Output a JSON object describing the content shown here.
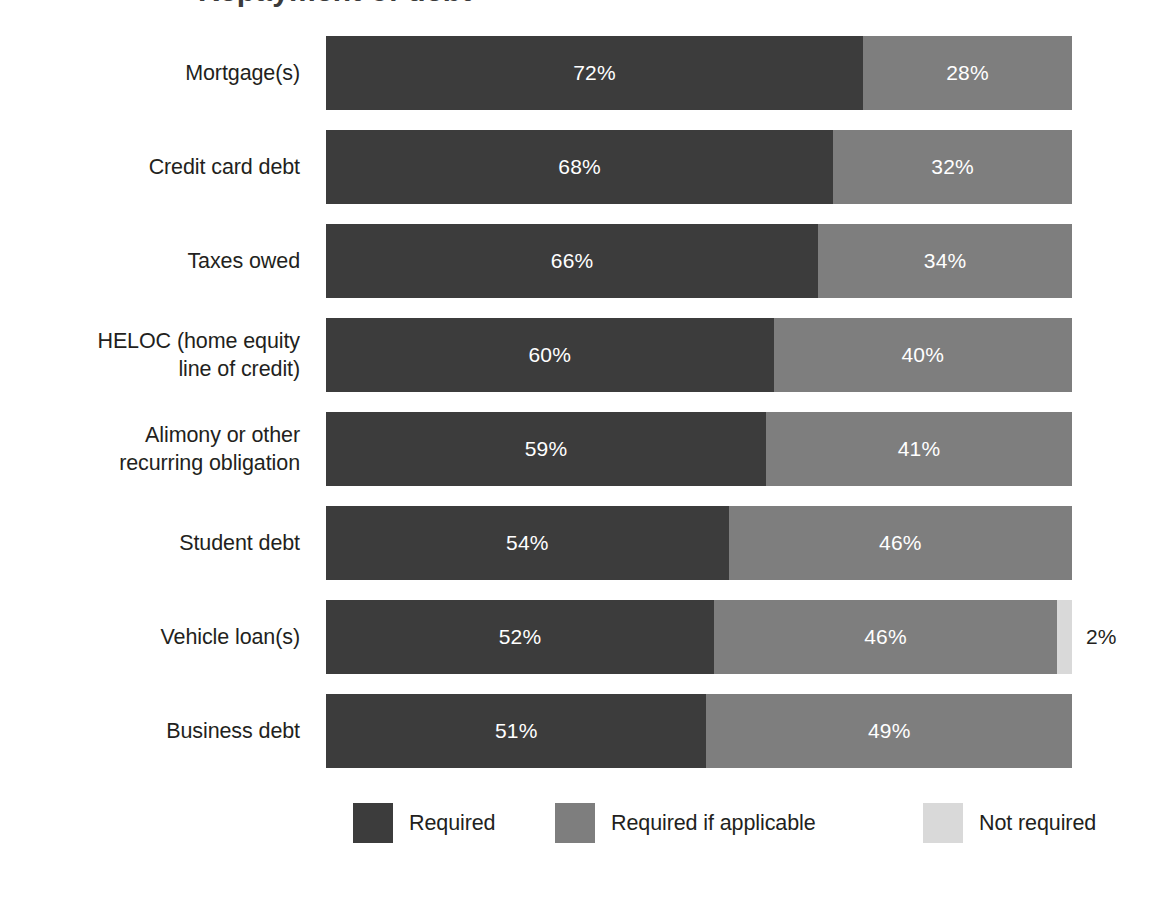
{
  "title_fragment": "Repayment of debt",
  "chart_data": {
    "type": "bar",
    "subtype": "stacked-horizontal-100",
    "title": "",
    "xlabel": "",
    "ylabel": "",
    "xlim": [
      0,
      100
    ],
    "grid": false,
    "legend_position": "bottom",
    "units": "%",
    "categories": [
      "Mortgage(s)",
      "Credit card debt",
      "Taxes owed",
      "HELOC (home equity line of credit)",
      "Alimony or other recurring obligation",
      "Student debt",
      "Vehicle loan(s)",
      "Business debt"
    ],
    "series": [
      {
        "name": "Required",
        "color": "#3c3c3c",
        "values": [
          72,
          68,
          66,
          60,
          59,
          54,
          52,
          51
        ]
      },
      {
        "name": "Required if applicable",
        "color": "#7e7e7e",
        "values": [
          28,
          32,
          34,
          40,
          41,
          46,
          46,
          49
        ]
      },
      {
        "name": "Not required",
        "color": "#d9d9d9",
        "values": [
          0,
          0,
          0,
          0,
          0,
          0,
          2,
          0
        ]
      }
    ]
  },
  "rows": [
    {
      "label_lines": [
        "Mortgage(s)"
      ],
      "segments": [
        {
          "series": "Required",
          "value": 72,
          "value_label": "72%",
          "color": "#3c3c3c",
          "label_outside": false
        },
        {
          "series": "Required if applicable",
          "value": 28,
          "value_label": "28%",
          "color": "#7e7e7e",
          "label_outside": false
        }
      ]
    },
    {
      "label_lines": [
        "Credit card debt"
      ],
      "segments": [
        {
          "series": "Required",
          "value": 68,
          "value_label": "68%",
          "color": "#3c3c3c",
          "label_outside": false
        },
        {
          "series": "Required if applicable",
          "value": 32,
          "value_label": "32%",
          "color": "#7e7e7e",
          "label_outside": false
        }
      ]
    },
    {
      "label_lines": [
        "Taxes owed"
      ],
      "segments": [
        {
          "series": "Required",
          "value": 66,
          "value_label": "66%",
          "color": "#3c3c3c",
          "label_outside": false
        },
        {
          "series": "Required if applicable",
          "value": 34,
          "value_label": "34%",
          "color": "#7e7e7e",
          "label_outside": false
        }
      ]
    },
    {
      "label_lines": [
        "HELOC (home equity",
        "line of credit)"
      ],
      "segments": [
        {
          "series": "Required",
          "value": 60,
          "value_label": "60%",
          "color": "#3c3c3c",
          "label_outside": false
        },
        {
          "series": "Required if applicable",
          "value": 40,
          "value_label": "40%",
          "color": "#7e7e7e",
          "label_outside": false
        }
      ]
    },
    {
      "label_lines": [
        "Alimony or other",
        "recurring obligation"
      ],
      "segments": [
        {
          "series": "Required",
          "value": 59,
          "value_label": "59%",
          "color": "#3c3c3c",
          "label_outside": false
        },
        {
          "series": "Required if applicable",
          "value": 41,
          "value_label": "41%",
          "color": "#7e7e7e",
          "label_outside": false
        }
      ]
    },
    {
      "label_lines": [
        "Student debt"
      ],
      "segments": [
        {
          "series": "Required",
          "value": 54,
          "value_label": "54%",
          "color": "#3c3c3c",
          "label_outside": false
        },
        {
          "series": "Required if applicable",
          "value": 46,
          "value_label": "46%",
          "color": "#7e7e7e",
          "label_outside": false
        }
      ]
    },
    {
      "label_lines": [
        "Vehicle loan(s)"
      ],
      "segments": [
        {
          "series": "Required",
          "value": 52,
          "value_label": "52%",
          "color": "#3c3c3c",
          "label_outside": false
        },
        {
          "series": "Required if applicable",
          "value": 46,
          "value_label": "46%",
          "color": "#7e7e7e",
          "label_outside": false
        },
        {
          "series": "Not required",
          "value": 2,
          "value_label": "2%",
          "color": "#d9d9d9",
          "label_outside": true
        }
      ]
    },
    {
      "label_lines": [
        "Business debt"
      ],
      "segments": [
        {
          "series": "Required",
          "value": 51,
          "value_label": "51%",
          "color": "#3c3c3c",
          "label_outside": false
        },
        {
          "series": "Required if applicable",
          "value": 49,
          "value_label": "49%",
          "color": "#7e7e7e",
          "label_outside": false
        }
      ]
    }
  ],
  "legend": {
    "items": [
      {
        "label": "Required",
        "color": "#3c3c3c",
        "left": 353
      },
      {
        "label": "Required if applicable",
        "color": "#7e7e7e",
        "left": 555
      },
      {
        "label": "Not required",
        "color": "#d9d9d9",
        "left": 923
      }
    ]
  },
  "layout": {
    "bar_left": 326,
    "bar_width": 746,
    "bar_height": 74,
    "row_pitch": 94,
    "first_row_top": 36
  }
}
